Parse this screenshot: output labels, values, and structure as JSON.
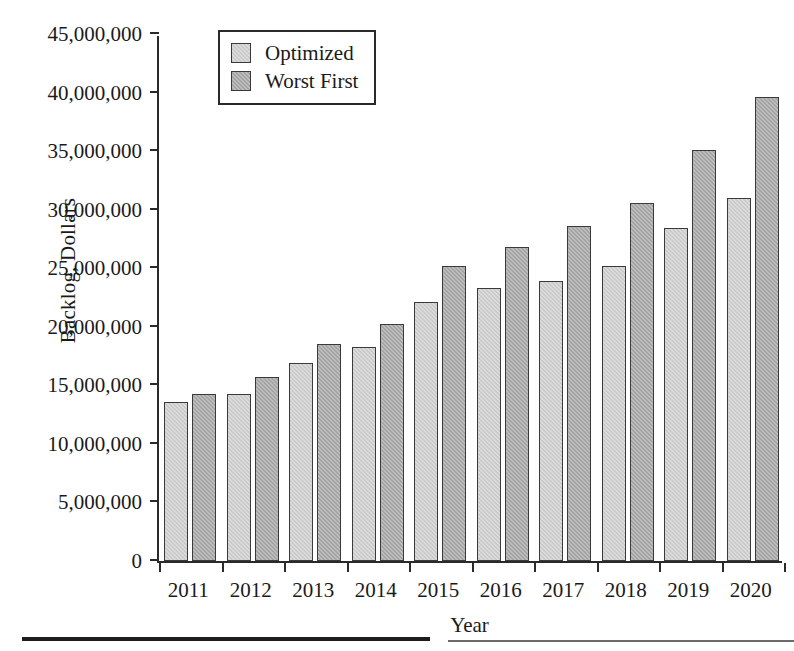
{
  "chart_data": {
    "type": "bar",
    "title": "",
    "xlabel": "Year",
    "ylabel": "Backlog, Dollars",
    "categories": [
      "2011",
      "2012",
      "2013",
      "2014",
      "2015",
      "2016",
      "2017",
      "2018",
      "2019",
      "2020"
    ],
    "series": [
      {
        "name": "Optimized",
        "color": "#c9c9c9",
        "values": [
          13600000,
          14300000,
          16900000,
          18300000,
          22100000,
          23300000,
          23900000,
          25200000,
          28400000,
          31000000
        ]
      },
      {
        "name": "Worst First",
        "color": "#a3a3a3",
        "values": [
          14300000,
          15700000,
          18500000,
          20200000,
          25200000,
          26800000,
          28600000,
          30600000,
          35100000,
          39600000
        ]
      }
    ],
    "ylim": [
      0,
      45000000
    ],
    "ytick_values": [
      0,
      5000000,
      10000000,
      15000000,
      20000000,
      25000000,
      30000000,
      35000000,
      40000000,
      45000000
    ],
    "ytick_labels": [
      "0",
      "5,000,000",
      "10,000,000",
      "15,000,000",
      "20,000,000",
      "25,000,000",
      "30,000,000",
      "35,000,000",
      "40,000,000",
      "45,000,000"
    ],
    "grid": false,
    "legend_position": "top-center",
    "legend_entries": [
      "Optimized",
      "Worst First"
    ]
  }
}
